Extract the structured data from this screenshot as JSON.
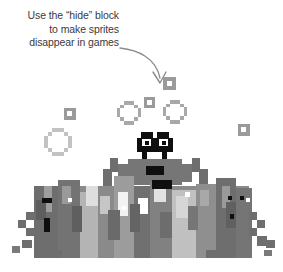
{
  "illustration": {
    "caption": {
      "lines": [
        "Use the “hide” block",
        "to make sprites",
        "disappear in games"
      ],
      "text_color": "#3a3a3a",
      "align": "right"
    },
    "arrow": {
      "name": "curved-pointer-arrow",
      "color": "#8c8c8c",
      "direction": "down",
      "head_style": "open-chevron"
    },
    "scene": {
      "title": "pixelated retro game sprites",
      "background": "#ffffff",
      "palette": {
        "black": "#0f0f0f",
        "dark_grey": "#6e6e6e",
        "mid_grey": "#8c8c8c",
        "light_grey": "#b4b4b4",
        "pale_grey": "#cfcfcf",
        "white": "#ffffff"
      },
      "elements": {
        "bubbles": [
          {
            "name": "bubble-large-left",
            "x": 44,
            "y": 128,
            "size": 30,
            "color": "#c2c2c2"
          },
          {
            "name": "bubble-mid-center",
            "x": 117,
            "y": 101,
            "size": 24,
            "color": "#a8a8a8"
          },
          {
            "name": "bubble-mid-right",
            "x": 163,
            "y": 100,
            "size": 24,
            "color": "#a8a8a8"
          }
        ],
        "blocks": [
          {
            "name": "block-upper-right",
            "x": 163,
            "y": 77,
            "size": 13,
            "color": "#9a9a9a"
          },
          {
            "name": "block-center-top",
            "x": 144,
            "y": 97,
            "size": 11,
            "color": "#9a9a9a"
          },
          {
            "name": "block-left",
            "x": 64,
            "y": 108,
            "size": 12,
            "color": "#9a9a9a"
          },
          {
            "name": "block-right",
            "x": 238,
            "y": 124,
            "size": 12,
            "color": "#9a9a9a"
          }
        ],
        "hero_sprite": {
          "name": "black-headed-crab-creature",
          "head_color": "#0f0f0f",
          "eye_color": "#ffffff",
          "body_color": "#767676",
          "mouth_color": "#0f0f0f"
        },
        "crowd": {
          "name": "sprite-crowd",
          "description": "dense cluster of grey pixel monsters along the bottom"
        }
      }
    }
  }
}
